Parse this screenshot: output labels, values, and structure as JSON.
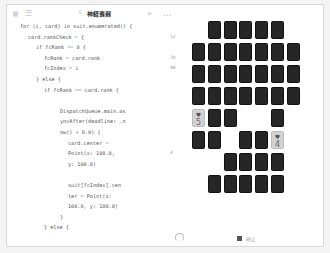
{
  "toolbar": {
    "title": "神経衰弱",
    "icons": [
      "sidebar-icon",
      "list-icon",
      "chevron-left-icon",
      "plus-icon",
      "more-icon"
    ],
    "glyphs": {
      "sidebar": "▦",
      "list": "☰",
      "back": "‹",
      "plus": "+",
      "more": "•••"
    }
  },
  "code": {
    "lines": [
      {
        "text": "for (i, card) in suit.enumerated() {",
        "indent": 0,
        "result": ""
      },
      {
        "text": "card.rankCheck = {",
        "indent": 1,
        "result": "52"
      },
      {
        "text": "if fcRank == 0 {",
        "indent": 2,
        "result": ""
      },
      {
        "text": "fcRank = card.rank",
        "indent": 3,
        "result": "70"
      },
      {
        "text": "fcIndex = i",
        "indent": 3,
        "result": "98"
      },
      {
        "text": "} else {",
        "indent": 2,
        "result": ""
      },
      {
        "text": "if fcRank == card.rank {",
        "indent": 3,
        "result": ""
      },
      {
        "text": "",
        "indent": 0,
        "result": ""
      },
      {
        "text": "DispatchQueue.main.as",
        "indent": 5,
        "result": ""
      },
      {
        "text": "yncAfter(deadline: .n",
        "indent": 5,
        "result": ""
      },
      {
        "text": "ow() + 0.9) {",
        "indent": 5,
        "result": ""
      },
      {
        "text": "card.center =",
        "indent": 6,
        "result": ""
      },
      {
        "text": "Point(x: 100.0,",
        "indent": 6,
        "result": "4"
      },
      {
        "text": "y: 100.0)",
        "indent": 6,
        "result": ""
      },
      {
        "text": "",
        "indent": 0,
        "result": ""
      },
      {
        "text": "suit[fcIndex].cen",
        "indent": 6,
        "result": ""
      },
      {
        "text": "ter = Point(x:",
        "indent": 6,
        "result": ""
      },
      {
        "text": "100.0, y: 100.0)",
        "indent": 6,
        "result": ""
      },
      {
        "text": "}",
        "indent": 5,
        "result": ""
      },
      {
        "text": "} else {",
        "indent": 3,
        "result": ""
      },
      {
        "text": "",
        "indent": 0,
        "result": ""
      },
      {
        "text": "DispatchQueue.main.as",
        "indent": 5,
        "result": ""
      },
      {
        "text": "yncAfter(deadline: .n",
        "indent": 5,
        "result": ""
      },
      {
        "text": "ow() + 0.9) {",
        "indent": 5,
        "result": ""
      }
    ]
  },
  "board": {
    "columns": 7,
    "rows": [
      [
        "",
        "down",
        "down",
        "down",
        "down",
        "down",
        ""
      ],
      [
        "down",
        "down",
        "down",
        "down",
        "down",
        "down",
        "down"
      ],
      [
        "down",
        "down",
        "down",
        "down",
        "down",
        "down",
        "down"
      ],
      [
        "down",
        "down",
        "down",
        "down",
        "down",
        "down",
        "down"
      ],
      [
        "up:♥:5",
        "down",
        "down",
        "",
        "",
        "down",
        ""
      ],
      [
        "down",
        "down",
        "",
        "down",
        "down",
        "up:♥:4",
        ""
      ],
      [
        "",
        "",
        "down",
        "down",
        "down",
        "down",
        ""
      ],
      [
        "",
        "down",
        "down",
        "down",
        "down",
        "down",
        ""
      ]
    ]
  },
  "controls": {
    "restart_icon": "restart-icon",
    "stop_label": "停止"
  }
}
